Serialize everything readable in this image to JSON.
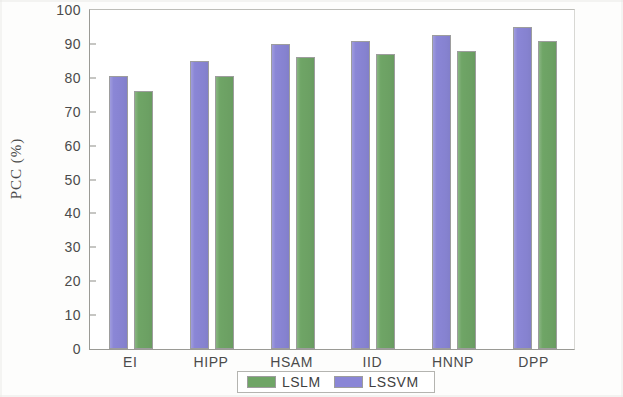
{
  "chart_data": {
    "type": "bar",
    "title": "",
    "xlabel": "",
    "ylabel": "PCC (%)",
    "categories": [
      "EI",
      "HIPP",
      "HSAM",
      "IID",
      "HNNP",
      "DPP"
    ],
    "series": [
      {
        "name": "LSSVM",
        "color": "#8a86d6",
        "values": [
          80.5,
          85.0,
          90.0,
          91.0,
          92.5,
          95.0
        ]
      },
      {
        "name": "LSLM",
        "color": "#6fa566",
        "values": [
          76.0,
          80.5,
          86.0,
          87.0,
          88.0,
          91.0
        ]
      }
    ],
    "ylim": [
      0,
      100
    ],
    "yticks": [
      100,
      90,
      80,
      70,
      60,
      50,
      40,
      30,
      20,
      10,
      0
    ],
    "grid": false,
    "legend_position": "bottom-center",
    "legend_entries": [
      "LSLM",
      "LSSVM"
    ]
  },
  "legend": {
    "entries": [
      {
        "label": "LSLM",
        "swatch": "green-swatch-icon"
      },
      {
        "label": "LSSVM",
        "swatch": "purple-swatch-icon"
      }
    ]
  }
}
